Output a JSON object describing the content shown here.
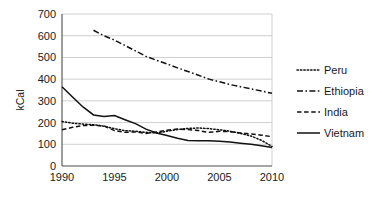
{
  "chart_data": {
    "type": "line",
    "title": "",
    "xlabel": "",
    "ylabel": "kCal",
    "xlim": [
      1990,
      2010
    ],
    "ylim": [
      0,
      700
    ],
    "grid": true,
    "legend_position": "right",
    "x_ticks": [
      "1990",
      "1995",
      "2000",
      "2005",
      "2010"
    ],
    "x_tick_values": [
      1990,
      1995,
      2000,
      2005,
      2010
    ],
    "y_ticks": [
      "0",
      "100",
      "200",
      "300",
      "400",
      "500",
      "600",
      "700"
    ],
    "y_tick_values": [
      0,
      100,
      200,
      300,
      400,
      500,
      600,
      700
    ],
    "series": [
      {
        "name": "Peru",
        "style": "dotted",
        "x": [
          1990,
          1991,
          1992,
          1993,
          1994,
          1995,
          1996,
          1997,
          1998,
          1999,
          2000,
          2001,
          2002,
          2003,
          2004,
          2005,
          2006,
          2007,
          2008,
          2009,
          2010
        ],
        "values": [
          205,
          197,
          193,
          190,
          183,
          172,
          163,
          160,
          155,
          152,
          160,
          168,
          173,
          175,
          172,
          167,
          160,
          150,
          138,
          118,
          90
        ]
      },
      {
        "name": "Ethiopia",
        "style": "dash-dot",
        "x": [
          1993,
          1994,
          1995,
          1996,
          1997,
          1998,
          1999,
          2000,
          2001,
          2002,
          2003,
          2004,
          2005,
          2006,
          2007,
          2008,
          2009,
          2010
        ],
        "values": [
          625,
          600,
          580,
          555,
          530,
          505,
          487,
          470,
          452,
          435,
          418,
          400,
          388,
          375,
          365,
          355,
          345,
          335
        ]
      },
      {
        "name": "India",
        "style": "dashed",
        "x": [
          1990,
          1991,
          1992,
          1993,
          1994,
          1995,
          1996,
          1997,
          1998,
          1999,
          2000,
          2001,
          2002,
          2003,
          2004,
          2005,
          2006,
          2007,
          2008,
          2009,
          2010
        ],
        "values": [
          167,
          178,
          186,
          188,
          185,
          163,
          155,
          157,
          150,
          157,
          165,
          170,
          168,
          163,
          155,
          160,
          158,
          152,
          148,
          142,
          135
        ]
      },
      {
        "name": "Vietnam",
        "style": "solid",
        "x": [
          1990,
          1991,
          1992,
          1993,
          1994,
          1995,
          1996,
          1997,
          1998,
          1999,
          2000,
          2001,
          2002,
          2003,
          2004,
          2005,
          2006,
          2007,
          2008,
          2009,
          2010
        ],
        "values": [
          365,
          318,
          272,
          235,
          228,
          232,
          213,
          195,
          170,
          152,
          140,
          128,
          118,
          116,
          116,
          114,
          110,
          105,
          100,
          93,
          85
        ]
      }
    ]
  },
  "legend": {
    "items": [
      {
        "label": "Peru"
      },
      {
        "label": "Ethiopia"
      },
      {
        "label": "India"
      },
      {
        "label": "Vietnam"
      }
    ]
  },
  "colors": {
    "series": "#111111",
    "grid": "#c9c9c9",
    "axis": "#4d4d4d",
    "text": "#1a1a1a",
    "background": "#ffffff"
  }
}
